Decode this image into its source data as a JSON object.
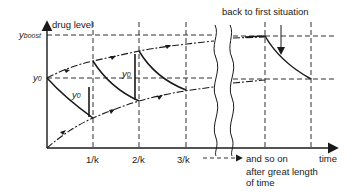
{
  "figure": {
    "y_axis_label": "drug level",
    "x_axis_label": "time",
    "y_boost_label": "y",
    "y_boost_sub": "boost",
    "y0_label": "y",
    "y0_sub": "0",
    "dose_label_1": "y",
    "dose_label_1_sub": "0",
    "dose_label_2": "y",
    "dose_label_2_sub": "0",
    "top_annotation": "back to first situation",
    "continuation_text": "and so on",
    "continuation_note_line1": "after great length",
    "continuation_note_line2": "of time",
    "x_ticks": [
      "1/k",
      "2/k",
      "3/k"
    ],
    "line_color": "#1a1a1a",
    "background": "#ffffff"
  }
}
